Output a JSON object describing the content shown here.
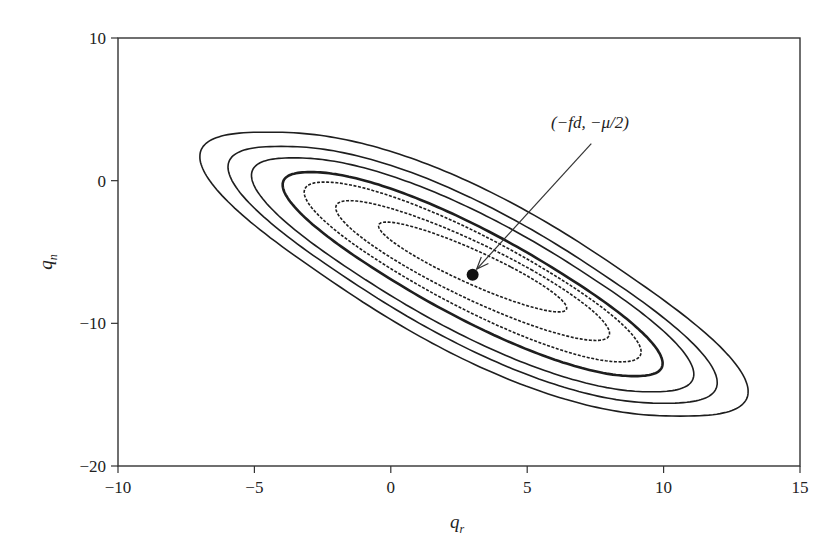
{
  "chart_data": {
    "type": "contour",
    "title": "",
    "xlabel": "q_r",
    "ylabel": "q_n",
    "xlabel_main": "q",
    "xlabel_sub": "r",
    "ylabel_main": "q",
    "ylabel_sub": "n",
    "xlim": [
      -10,
      15
    ],
    "ylim": [
      -20,
      10
    ],
    "xticks": [
      -10,
      -5,
      0,
      5,
      10,
      15
    ],
    "yticks": [
      -20,
      -10,
      0,
      10
    ],
    "xtick_labels": [
      "−10",
      "−5",
      "0",
      "5",
      "10",
      "15"
    ],
    "ytick_labels": [
      "−20",
      "−10",
      "0",
      "10"
    ],
    "grid": false,
    "legend": null,
    "center_point": {
      "x": 3.0,
      "y": -6.6
    },
    "annotation": {
      "text": "(−fd, −μ/2)",
      "text_pos": {
        "x": 7.3,
        "y": 3.7
      },
      "arrow_from": {
        "x": 7.35,
        "y": 2.6
      },
      "arrow_to": {
        "x": 3.15,
        "y": -6.2
      }
    },
    "contours": [
      {
        "style": "solid",
        "weight": "thin",
        "cx": 3.05,
        "cy": -6.55,
        "a": 5.6,
        "b": 9.95,
        "shear": 0.76,
        "n": 2.5
      },
      {
        "style": "solid",
        "weight": "thin",
        "cx": 3.0,
        "cy": -6.6,
        "a": 4.8,
        "b": 9.0,
        "shear": 0.78,
        "n": 2.4
      },
      {
        "style": "solid",
        "weight": "thin",
        "cx": 3.0,
        "cy": -6.6,
        "a": 4.2,
        "b": 8.2,
        "shear": 0.8,
        "n": 2.3
      },
      {
        "style": "solid",
        "weight": "thick",
        "cx": 3.0,
        "cy": -6.55,
        "a": 3.3,
        "b": 7.15,
        "shear": 0.83,
        "n": 2.2
      },
      {
        "style": "dashed",
        "weight": "thin",
        "cx": 3.0,
        "cy": -6.4,
        "a": 2.8,
        "b": 6.3,
        "shear": 0.86,
        "n": 2.1
      },
      {
        "style": "dashed",
        "weight": "thin",
        "cx": 3.0,
        "cy": -6.3,
        "a": 2.2,
        "b": 4.9,
        "shear": 0.92,
        "n": 2.0
      },
      {
        "style": "dashed",
        "weight": "thin",
        "cx": 3.0,
        "cy": -6.05,
        "a": 1.4,
        "b": 3.15,
        "shear": 1.0,
        "n": 2.0
      }
    ],
    "colors": {
      "line": "#1e1e1e",
      "axis": "#333333",
      "background": "#ffffff"
    }
  },
  "layout": {
    "plot": {
      "left": 118,
      "top": 38,
      "right": 800,
      "bottom": 466
    }
  }
}
